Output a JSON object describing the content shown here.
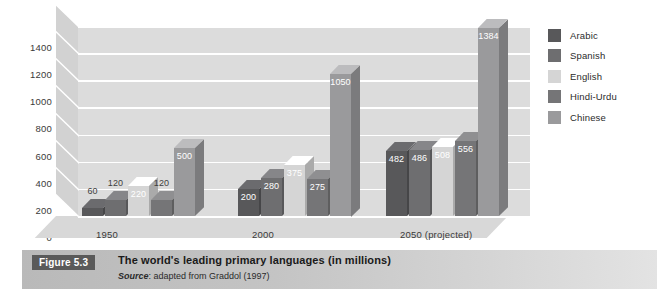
{
  "chart_data": {
    "type": "bar",
    "title": "The world's leading primary languages (in millions)",
    "xlabel": "",
    "ylabel": "",
    "ylim": [
      0,
      1400
    ],
    "yticks": [
      0,
      200,
      400,
      600,
      800,
      1000,
      1200,
      1400
    ],
    "ytick_labels": [
      "0",
      "200",
      "400",
      "600",
      "800",
      "1000",
      "1200",
      "1400"
    ],
    "categories": [
      "1950",
      "2000",
      "2050 (projected)"
    ],
    "grid": true,
    "legend_position": "right",
    "three_d": true,
    "series": [
      {
        "name": "Arabic",
        "color": "#58585a",
        "values": [
          60,
          200,
          482
        ]
      },
      {
        "name": "Spanish",
        "color": "#6e6e70",
        "values": [
          120,
          280,
          486
        ]
      },
      {
        "name": "English",
        "color": "#d5d5d5",
        "values": [
          220,
          375,
          508
        ]
      },
      {
        "name": "Hindi-Urdu",
        "color": "#757577",
        "values": [
          120,
          275,
          556
        ]
      },
      {
        "name": "Chinese",
        "color": "#9a9a9c",
        "values": [
          500,
          1050,
          1384
        ]
      }
    ],
    "legend_entries": [
      "Arabic",
      "Spanish",
      "English",
      "Hindi-Urdu",
      "Chinese"
    ],
    "value_labels": {
      "1950": [
        "60",
        "120",
        "220",
        "120",
        "500"
      ],
      "2000": [
        "200",
        "280",
        "375",
        "275",
        "1050"
      ],
      "2050 (projected)": [
        "482",
        "486",
        "508",
        "556",
        "1384"
      ]
    },
    "plot_background": "#dcdcdc",
    "gridline_color": "#ffffff"
  },
  "caption": {
    "figure_number": "Figure 5.3",
    "title": "The world's leading primary languages (in millions)",
    "source_word": "Source",
    "source_text": ": adapted from Graddol (1997)"
  }
}
